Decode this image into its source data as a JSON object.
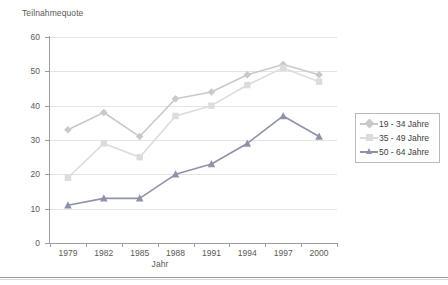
{
  "chart_data": {
    "type": "line",
    "title": "Teilnahmequote",
    "xlabel": "Jahr",
    "ylabel": "",
    "categories": [
      "1979",
      "1982",
      "1985",
      "1988",
      "1991",
      "1994",
      "1997",
      "2000"
    ],
    "x": [
      1979,
      1982,
      1985,
      1988,
      1991,
      1994,
      1997,
      2000
    ],
    "ylim": [
      0,
      60
    ],
    "yticks": [
      "0",
      "10",
      "20",
      "30",
      "40",
      "50",
      "60"
    ],
    "ytick_values": [
      0,
      10,
      20,
      30,
      40,
      50,
      60
    ],
    "grid": "horizontal",
    "legend_position": "right",
    "series": [
      {
        "name": "19 - 34 Jahre",
        "color": "#c9c9c9",
        "marker": "diamond",
        "values": [
          33,
          38,
          31,
          42,
          44,
          49,
          52,
          49
        ]
      },
      {
        "name": "35 - 49 Jahre",
        "color": "#dcdcdc",
        "marker": "square",
        "values": [
          19,
          29,
          25,
          37,
          40,
          46,
          51,
          47
        ]
      },
      {
        "name": "50 - 64 Jahre",
        "color": "#8e93a8",
        "marker": "triangle",
        "values": [
          11,
          13,
          13,
          20,
          23,
          29,
          37,
          31
        ]
      }
    ]
  },
  "legend": {
    "items": [
      {
        "label": "19 - 34 Jahre"
      },
      {
        "label": "35 - 49 Jahre"
      },
      {
        "label": "50 - 64 Jahre"
      }
    ]
  },
  "colors": {
    "axis": "#9d9d9d",
    "grid": "#e4e4e4",
    "text": "#595959",
    "background": "#ffffff"
  }
}
